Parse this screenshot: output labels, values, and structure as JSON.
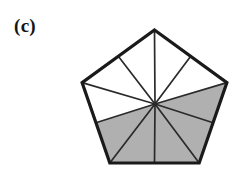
{
  "figure": {
    "panel_label": "(c)",
    "caption_position": "top-left",
    "background_color": "#ffffff"
  },
  "colors": {
    "outline": "#1a1a1a",
    "spoke": "#2a2a2a",
    "shaded_fill": "#b0b0b0",
    "unshaded_fill": "#ffffff",
    "label_color": "#141414"
  },
  "geometry": {
    "shape": "regular-pentagon",
    "center": {
      "x": 155,
      "y": 104
    },
    "circumradius": 74,
    "outer_stroke_width": 3.2,
    "spoke_stroke_width": 1.7,
    "vertices": [
      {
        "name": "top",
        "x": 154.5,
        "y": 30
      },
      {
        "name": "right",
        "x": 226.9,
        "y": 82.6
      },
      {
        "name": "bottom-right",
        "x": 199.2,
        "y": 163
      },
      {
        "name": "bottom-left",
        "x": 109.8,
        "y": 163
      },
      {
        "name": "left",
        "x": 82.1,
        "y": 82.6
      }
    ],
    "edge_midpoints": [
      {
        "name": "upper-right-mid",
        "x": 190.7,
        "y": 56.3
      },
      {
        "name": "lower-right-mid",
        "x": 213.1,
        "y": 122.8
      },
      {
        "name": "bottom-mid",
        "x": 154.5,
        "y": 163
      },
      {
        "name": "lower-left-mid",
        "x": 95.9,
        "y": 122.8
      },
      {
        "name": "upper-left-mid",
        "x": 118.3,
        "y": 56.3
      }
    ]
  },
  "chart_data": {
    "type": "diagram",
    "total_triangles": 10,
    "shaded_count": 5,
    "unshaded_count": 5,
    "shaded_fraction": "1/2",
    "triangles": [
      {
        "id": "t1",
        "points": "155,104 154.5,30 118.3,56.3",
        "shaded": false
      },
      {
        "id": "t2",
        "points": "155,104 118.3,56.3 82.1,82.6",
        "shaded": false
      },
      {
        "id": "t3",
        "points": "155,104 82.1,82.6 95.9,122.8",
        "shaded": false
      },
      {
        "id": "t4",
        "points": "155,104 95.9,122.8 109.8,163",
        "shaded": true
      },
      {
        "id": "t5",
        "points": "155,104 109.8,163 154.5,163",
        "shaded": true
      },
      {
        "id": "t6",
        "points": "155,104 154.5,163 199.2,163",
        "shaded": true
      },
      {
        "id": "t7",
        "points": "155,104 199.2,163 213.1,122.8",
        "shaded": true
      },
      {
        "id": "t8",
        "points": "155,104 213.1,122.8 226.9,82.6",
        "shaded": true
      },
      {
        "id": "t9",
        "points": "155,104 226.9,82.6 190.7,56.3",
        "shaded": false
      },
      {
        "id": "t10",
        "points": "155,104 190.7,56.3 154.5,30",
        "shaded": false
      }
    ],
    "spokes": [
      {
        "id": "s1",
        "to": "top",
        "x2": 154.5,
        "y2": 30
      },
      {
        "id": "s2",
        "to": "upper-right-mid",
        "x2": 190.7,
        "y2": 56.3
      },
      {
        "id": "s3",
        "to": "right",
        "x2": 226.9,
        "y2": 82.6
      },
      {
        "id": "s4",
        "to": "lower-right-mid",
        "x2": 213.1,
        "y2": 122.8
      },
      {
        "id": "s5",
        "to": "bottom-right",
        "x2": 199.2,
        "y2": 163
      },
      {
        "id": "s6",
        "to": "bottom-mid",
        "x2": 154.5,
        "y2": 163
      },
      {
        "id": "s7",
        "to": "bottom-left",
        "x2": 109.8,
        "y2": 163
      },
      {
        "id": "s8",
        "to": "lower-left-mid",
        "x2": 95.9,
        "y2": 122.8
      },
      {
        "id": "s9",
        "to": "left",
        "x2": 82.1,
        "y2": 82.6
      },
      {
        "id": "s10",
        "to": "upper-left-mid",
        "x2": 118.3,
        "y2": 56.3
      }
    ],
    "outline_points": "154.5,30 226.9,82.6 199.2,163 109.8,163 82.1,82.6"
  }
}
